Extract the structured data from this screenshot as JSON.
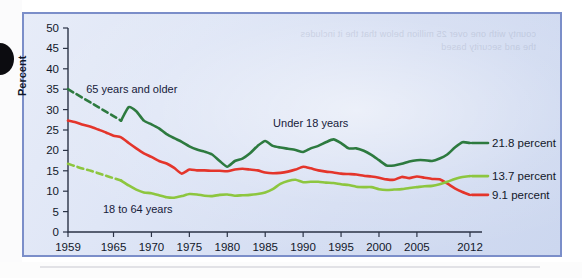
{
  "figure": {
    "panel_border_color": "#7b8ec9",
    "background_tint": "#dde5f5",
    "ghost_text": "county with one\nover 25 million\nbelow that the\nit includes the\nand security   based"
  },
  "chart_data": {
    "type": "line",
    "title": "",
    "xlabel": "",
    "ylabel": "Percent",
    "xlim": [
      1959,
      2012
    ],
    "ylim": [
      0,
      50
    ],
    "ytick_step": 5,
    "grid": false,
    "legend": "inline-annotations",
    "yticks": [
      0,
      5,
      10,
      15,
      20,
      25,
      30,
      35,
      40,
      45,
      50
    ],
    "ytick_labels": [
      "0",
      "5",
      "10",
      "15",
      "20",
      "25",
      "30",
      "35",
      "40",
      "45",
      "50"
    ],
    "xticks": [
      1959,
      1965,
      1970,
      1975,
      1980,
      1985,
      1990,
      1995,
      2000,
      2005,
      2012
    ],
    "xtick_labels": [
      "1959",
      "1965",
      "1970",
      "1975",
      "1980",
      "1985",
      "1990",
      "1995",
      "2000",
      "2005",
      "2012"
    ],
    "annotations": [
      {
        "text": "65 years and older",
        "series": "65 years and older",
        "x": 1961.4,
        "y": 35.0,
        "anchor": "start"
      },
      {
        "text": "Under 18 years",
        "series": "Under 18 years",
        "x": 1991.0,
        "y": 26.8,
        "anchor": "middle"
      },
      {
        "text": "18 to 64 years",
        "series": "18 to 64 years",
        "x": 1963.6,
        "y": 5.6,
        "anchor": "start"
      }
    ],
    "end_labels": [
      {
        "text": "21.8 percent",
        "series": "Under 18 years",
        "value": 21.8,
        "color": "#2d7a3f"
      },
      {
        "text": "13.7 percent",
        "series": "65 years and older",
        "value": 13.7,
        "color": "#8dc63f"
      },
      {
        "text": "9.1 percent",
        "series": "18 to 64 years",
        "value": 9.1,
        "color": "#e4352b"
      }
    ],
    "series": [
      {
        "name": "Under 18 years",
        "color": "#2d7a3f",
        "dashed_until": 1966,
        "note": "dashed 1959-1966 (interpolated), solid thereafter",
        "x": [
          1959,
          1960,
          1961,
          1962,
          1963,
          1964,
          1965,
          1966,
          1967,
          1968,
          1969,
          1970,
          1971,
          1972,
          1973,
          1974,
          1975,
          1976,
          1977,
          1978,
          1979,
          1980,
          1981,
          1982,
          1983,
          1984,
          1985,
          1986,
          1987,
          1988,
          1989,
          1990,
          1991,
          1992,
          1993,
          1994,
          1995,
          1996,
          1997,
          1998,
          1999,
          2000,
          2001,
          2002,
          2003,
          2004,
          2005,
          2006,
          2007,
          2008,
          2009,
          2010,
          2011,
          2012
        ],
        "y": [
          35.0,
          33.9,
          32.8,
          31.7,
          30.6,
          29.5,
          28.4,
          27.3,
          30.6,
          29.6,
          27.3,
          26.4,
          25.4,
          24.0,
          23.0,
          22.1,
          21.0,
          20.2,
          19.7,
          19.0,
          17.4,
          16.0,
          17.4,
          18.0,
          19.3,
          21.1,
          22.3,
          21.1,
          20.7,
          20.4,
          20.1,
          19.6,
          20.5,
          21.1,
          22.0,
          22.7,
          21.8,
          20.5,
          20.5,
          19.9,
          18.9,
          17.6,
          16.3,
          16.3,
          16.7,
          17.3,
          17.6,
          17.6,
          17.4,
          18.0,
          19.0,
          20.7,
          22.0,
          21.8
        ]
      },
      {
        "name": "18 to 64 years",
        "color": "#e4352b",
        "dashed_until": null,
        "note": "solid for full range",
        "x": [
          1959,
          1960,
          1961,
          1962,
          1963,
          1964,
          1965,
          1966,
          1967,
          1968,
          1969,
          1970,
          1971,
          1972,
          1973,
          1974,
          1975,
          1976,
          1977,
          1978,
          1979,
          1980,
          1981,
          1982,
          1983,
          1984,
          1985,
          1986,
          1987,
          1988,
          1989,
          1990,
          1991,
          1992,
          1993,
          1994,
          1995,
          1996,
          1997,
          1998,
          1999,
          2000,
          2001,
          2002,
          2003,
          2004,
          2005,
          2006,
          2007,
          2008,
          2009,
          2010,
          2011,
          2012
        ],
        "y": [
          27.3,
          26.9,
          26.3,
          25.8,
          25.1,
          24.4,
          23.6,
          23.2,
          21.8,
          20.5,
          19.3,
          18.4,
          17.4,
          16.8,
          15.7,
          14.3,
          15.3,
          15.1,
          15.1,
          15.0,
          15.0,
          14.9,
          15.3,
          15.5,
          15.3,
          15.1,
          14.6,
          14.4,
          14.5,
          14.8,
          15.3,
          16.0,
          15.6,
          15.1,
          14.8,
          14.6,
          14.3,
          14.2,
          14.1,
          13.8,
          13.6,
          13.3,
          12.9,
          12.8,
          13.5,
          13.2,
          13.6,
          13.3,
          13.0,
          12.9,
          11.9,
          10.7,
          9.8,
          9.1
        ]
      },
      {
        "name": "65 years and older",
        "color": "#8dc63f",
        "dashed_until": 1966,
        "note": "dashed 1959-1966 (interpolated), solid thereafter",
        "x": [
          1959,
          1960,
          1961,
          1962,
          1963,
          1964,
          1965,
          1966,
          1967,
          1968,
          1969,
          1970,
          1971,
          1972,
          1973,
          1974,
          1975,
          1976,
          1977,
          1978,
          1979,
          1980,
          1981,
          1982,
          1983,
          1984,
          1985,
          1986,
          1987,
          1988,
          1989,
          1990,
          1991,
          1992,
          1993,
          1994,
          1995,
          1996,
          1997,
          1998,
          1999,
          2000,
          2001,
          2002,
          2003,
          2004,
          2005,
          2006,
          2007,
          2008,
          2009,
          2010,
          2011,
          2012
        ],
        "y": [
          16.7,
          16.1,
          15.5,
          15.0,
          14.4,
          13.8,
          13.2,
          12.6,
          11.4,
          10.4,
          9.7,
          9.5,
          9.0,
          8.5,
          8.4,
          8.8,
          9.3,
          9.2,
          8.9,
          8.8,
          9.1,
          9.2,
          8.9,
          9.0,
          9.1,
          9.3,
          9.7,
          10.5,
          11.8,
          12.5,
          12.8,
          12.2,
          12.3,
          12.3,
          12.1,
          12.0,
          11.7,
          11.5,
          11.1,
          11.0,
          11.0,
          10.5,
          10.3,
          10.4,
          10.5,
          10.8,
          11.0,
          11.2,
          11.3,
          11.7,
          12.3,
          13.0,
          13.5,
          13.7
        ]
      }
    ]
  }
}
